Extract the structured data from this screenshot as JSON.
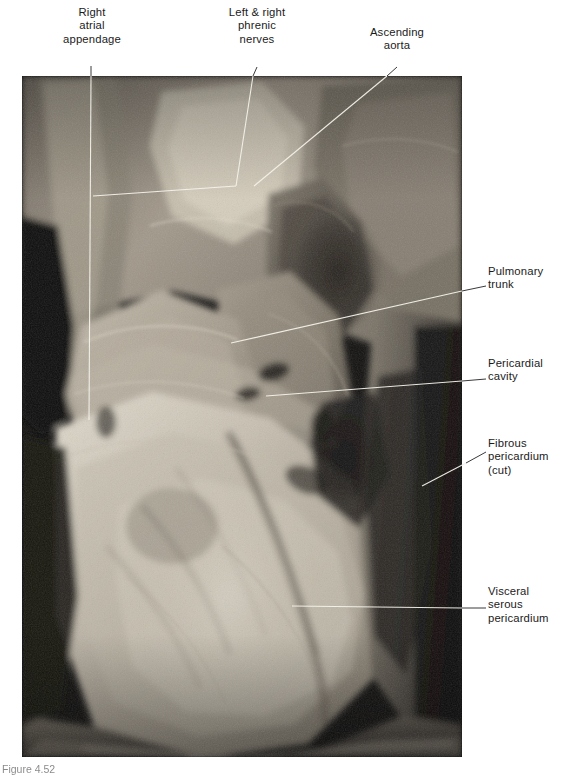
{
  "figure": {
    "type": "anatomical-photograph",
    "caption": "Figure 4.52"
  },
  "photo": {
    "background_color": "#0c0c0c",
    "tissue_light_color": "#d9d2c6",
    "tissue_mid_color": "#9b9287",
    "tissue_dark_color": "#4a443d"
  },
  "labels": [
    {
      "id": "right-atrial-appendage",
      "text": "Right\natrial\nappendage",
      "align": "center"
    },
    {
      "id": "phrenic-nerves",
      "text": "Left & right\nphrenic\nnerves",
      "align": "center"
    },
    {
      "id": "ascending-aorta",
      "text": "Ascending\naorta",
      "align": "center"
    },
    {
      "id": "pulmonary-trunk",
      "text": "Pulmonary\ntrunk",
      "align": "left"
    },
    {
      "id": "pericardial-cavity",
      "text": "Pericardial\ncavity",
      "align": "left"
    },
    {
      "id": "fibrous-pericardium",
      "text": "Fibrous\npericardium\n(cut)",
      "align": "left"
    },
    {
      "id": "visceral-serous-pericardium",
      "text": "Visceral\nserous\npericardium",
      "align": "left"
    }
  ],
  "leader_lines": {
    "color_on_white": "#3a3a3a",
    "color_on_photo": "#f2f0e8",
    "width": 1
  },
  "colors": {
    "text": "#1b1b1b",
    "page_background": "#ffffff"
  }
}
